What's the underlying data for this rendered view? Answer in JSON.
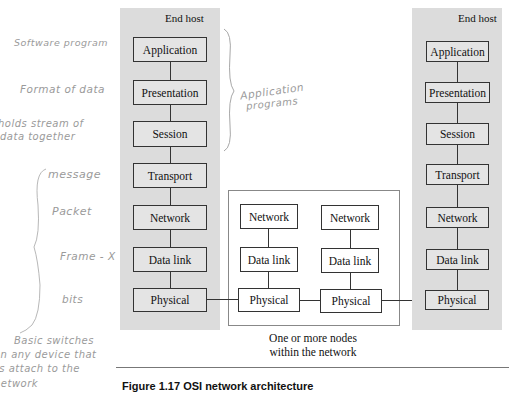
{
  "left_host": {
    "title": "End host",
    "layers": [
      "Application",
      "Presentation",
      "Session",
      "Transport",
      "Network",
      "Data link",
      "Physical"
    ]
  },
  "right_host": {
    "title": "End host",
    "layers": [
      "Application",
      "Presentation",
      "Session",
      "Transport",
      "Network",
      "Data link",
      "Physical"
    ]
  },
  "network_nodes": {
    "caption_line1": "One or more nodes",
    "caption_line2": "within the network",
    "node_a": [
      "Network",
      "Data link",
      "Physical"
    ],
    "node_b": [
      "Network",
      "Data link",
      "Physical"
    ]
  },
  "figure": {
    "caption": "Figure 1.17   OSI network architecture"
  },
  "handwritten_notes": {
    "application": "Software program",
    "presentation": "Format of data",
    "session_line1": "holds stream of",
    "session_line2": "data together",
    "transport": "message",
    "network": "Packet",
    "datalink": "Frame - X",
    "physical": "bits",
    "brace_label_line1": "Application",
    "brace_label_line2": "programs",
    "bottom_line1": "Basic switches",
    "bottom_line2": "on any device that",
    "bottom_line3": "is attach to the",
    "bottom_line4": "network"
  },
  "colors": {
    "host_panel": "#dcdcdc",
    "layer_box": "#e4e4e4",
    "border": "#333333",
    "handwriting": "#9a9a9a"
  }
}
